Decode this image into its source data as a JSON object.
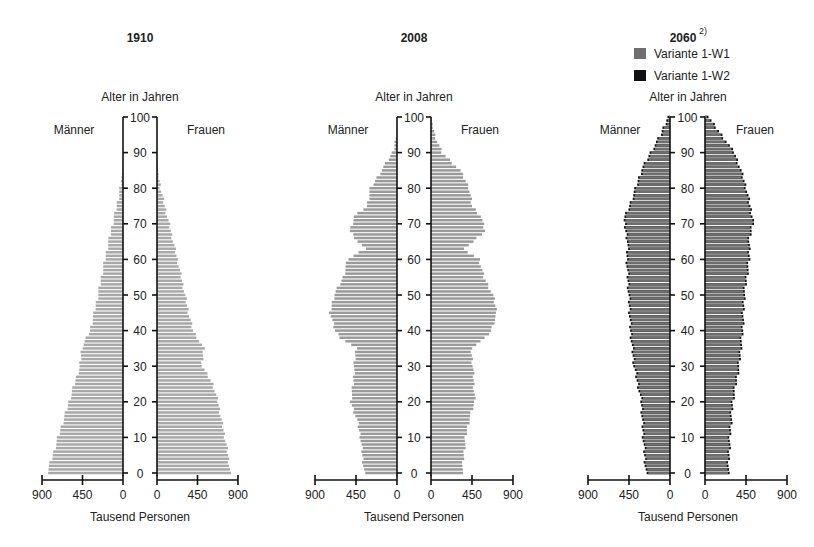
{
  "chart_data": [
    {
      "type": "bar",
      "subtype": "population-pyramid",
      "title": "1910",
      "ylabel": "Alter in Jahren",
      "xlabel": "Tausend Personen",
      "left_label": "Männer",
      "right_label": "Frauen",
      "xlim": [
        0,
        900
      ],
      "x_ticks_left": [
        "900",
        "450",
        "0"
      ],
      "x_ticks_right": [
        "0",
        "450",
        "900"
      ],
      "y_ticks": [
        "0",
        "10",
        "20",
        "30",
        "40",
        "50",
        "60",
        "70",
        "80",
        "90",
        "100"
      ],
      "age_keypoints": [
        0,
        5,
        10,
        15,
        20,
        25,
        30,
        35,
        40,
        45,
        50,
        55,
        60,
        65,
        70,
        75,
        80,
        85,
        90
      ],
      "series": [
        {
          "name": "Männer",
          "values": [
            844,
            780,
            722,
            660,
            600,
            540,
            478,
            460,
            367,
            320,
            278,
            240,
            200,
            160,
            115,
            70,
            30,
            8,
            2
          ]
        },
        {
          "name": "Frauen",
          "values": [
            811,
            790,
            755,
            715,
            678,
            620,
            500,
            520,
            400,
            350,
            311,
            270,
            225,
            180,
            135,
            85,
            40,
            12,
            3
          ]
        }
      ],
      "bar_color": "#a8a8a8"
    },
    {
      "type": "bar",
      "subtype": "population-pyramid",
      "title": "2008",
      "ylabel": "Alter in Jahren",
      "xlabel": "Tausend Personen",
      "left_label": "Männer",
      "right_label": "Frauen",
      "xlim": [
        0,
        900
      ],
      "x_ticks_left": [
        "900",
        "450",
        "0"
      ],
      "x_ticks_right": [
        "0",
        "450",
        "900"
      ],
      "y_ticks": [
        "0",
        "10",
        "20",
        "30",
        "40",
        "50",
        "60",
        "70",
        "80",
        "90",
        "100"
      ],
      "age_keypoints": [
        0,
        5,
        10,
        15,
        20,
        25,
        30,
        35,
        38,
        40,
        45,
        50,
        55,
        60,
        63,
        65,
        68,
        72,
        75,
        80,
        85,
        90,
        95,
        100
      ],
      "series": [
        {
          "name": "Männer",
          "values": [
            360,
            380,
            400,
            440,
            510,
            480,
            470,
            450,
            620,
            680,
            735,
            690,
            590,
            540,
            351,
            430,
            516,
            470,
            330,
            290,
            170,
            50,
            5,
            0
          ]
        },
        {
          "name": "Frauen",
          "values": [
            340,
            360,
            380,
            420,
            480,
            470,
            460,
            440,
            600,
            660,
            724,
            680,
            580,
            530,
            351,
            470,
            593,
            550,
            450,
            420,
            320,
            120,
            40,
            5
          ]
        }
      ],
      "bar_color": "#9a9a9a"
    },
    {
      "type": "bar",
      "subtype": "population-pyramid",
      "title": "2060",
      "title_superscript": "2)",
      "ylabel": "Alter in Jahren",
      "xlabel": "Tausend Personen",
      "left_label": "Männer",
      "right_label": "Frauen",
      "legend": [
        {
          "label": "Variante 1-W1",
          "color": "#6e6e6e"
        },
        {
          "label": "Variante 1-W2",
          "color": "#111111"
        }
      ],
      "legend_position": "top",
      "xlim": [
        0,
        900
      ],
      "x_ticks_left": [
        "900",
        "450",
        "0"
      ],
      "x_ticks_right": [
        "0",
        "450",
        "900"
      ],
      "y_ticks": [
        "0",
        "10",
        "20",
        "30",
        "40",
        "50",
        "60",
        "70",
        "80",
        "90",
        "100"
      ],
      "age_keypoints": [
        0,
        10,
        20,
        30,
        40,
        50,
        60,
        65,
        71,
        75,
        80,
        85,
        90,
        95,
        100
      ],
      "series": [
        {
          "name": "Männer (Variante 1-W1)",
          "values": [
            250,
            280,
            300,
            380,
            420,
            440,
            460,
            450,
            494,
            430,
            362,
            300,
            198,
            88,
            10
          ]
        },
        {
          "name": "Frauen (Variante 1-W1)",
          "values": [
            240,
            260,
            290,
            360,
            400,
            417,
            472,
            470,
            516,
            480,
            439,
            380,
            307,
            165,
            20
          ]
        }
      ],
      "w2_extra": 18,
      "bar_color": "#6e6e6e",
      "outline_color": "#111111"
    }
  ],
  "panels": [
    {
      "title": "1910",
      "sup": "",
      "ylabel": "Alter in Jahren",
      "left": "Männer",
      "right": "Frauen",
      "xlabel": "Tausend Personen"
    },
    {
      "title": "2008",
      "sup": "",
      "ylabel": "Alter in Jahren",
      "left": "Männer",
      "right": "Frauen",
      "xlabel": "Tausend Personen"
    },
    {
      "title": "2060",
      "sup": "2)",
      "ylabel": "Alter in Jahren",
      "left": "Männer",
      "right": "Frauen",
      "xlabel": "Tausend Personen"
    }
  ],
  "legend": {
    "w1": "Variante 1-W1",
    "w2": "Variante 1-W2"
  }
}
